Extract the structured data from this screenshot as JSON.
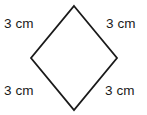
{
  "figure": {
    "shape_name": "rhombus",
    "background_color": "#ffffff",
    "stroke_color": "#1a1a1a",
    "fill_color": "#ffffff",
    "stroke_width": 1.8,
    "canvas": {
      "width": 147,
      "height": 115
    },
    "vertices": {
      "top": {
        "x": 74,
        "y": 6
      },
      "right": {
        "x": 117,
        "y": 58
      },
      "bottom": {
        "x": 74,
        "y": 110
      },
      "left": {
        "x": 31,
        "y": 58
      }
    },
    "polygon_points": "74,6 117,58 74,110 31,58",
    "labels": {
      "top_left": "3 cm",
      "top_right": "3 cm",
      "bottom_left": "3 cm",
      "bottom_right": "3 cm"
    }
  }
}
